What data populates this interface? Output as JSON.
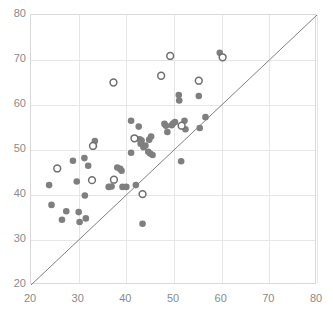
{
  "chart_data": {
    "type": "scatter",
    "title": "",
    "subtitle": "",
    "xlabel": "",
    "ylabel": "",
    "xlim": [
      20,
      80
    ],
    "ylim": [
      20,
      80
    ],
    "xticks": [
      20,
      30,
      40,
      50,
      60,
      70,
      80
    ],
    "yticks": [
      20,
      30,
      40,
      50,
      60,
      70,
      80
    ],
    "grid": true,
    "legend": "none",
    "annotations": [
      {
        "name": "identity-line",
        "type": "line",
        "description": "diagonal reference line y = x",
        "from": [
          20,
          20
        ],
        "to": [
          80,
          80
        ],
        "color": "#808080"
      }
    ],
    "colors": {
      "filled_marker": "#7f7f7f",
      "open_marker_fill": "#ffffff",
      "open_marker_stroke": "#6e6e6e",
      "grid": "#e6e6e6",
      "axis": "#d9d9d9",
      "tick_label": "#8a8a8a",
      "identity_line": "#808080"
    },
    "series": [
      {
        "name": "filled",
        "marker": "filled-circle",
        "color": "#7f7f7f",
        "points": [
          [
            23.8,
            42.2
          ],
          [
            24.3,
            37.8
          ],
          [
            26.5,
            34.5
          ],
          [
            27.4,
            36.4
          ],
          [
            28.8,
            47.6
          ],
          [
            29.6,
            43.0
          ],
          [
            30.0,
            36.2
          ],
          [
            30.2,
            34.0
          ],
          [
            31.2,
            48.2
          ],
          [
            31.3,
            39.9
          ],
          [
            31.5,
            34.8
          ],
          [
            32.0,
            46.5
          ],
          [
            33.2,
            51.0
          ],
          [
            33.4,
            52.0
          ],
          [
            36.3,
            41.8
          ],
          [
            36.9,
            41.9
          ],
          [
            38.1,
            46.1
          ],
          [
            38.7,
            45.8
          ],
          [
            39.0,
            45.4
          ],
          [
            39.2,
            41.8
          ],
          [
            40.0,
            41.8
          ],
          [
            41.0,
            56.5
          ],
          [
            41.0,
            49.4
          ],
          [
            42.0,
            42.2
          ],
          [
            42.6,
            55.2
          ],
          [
            42.8,
            52.4
          ],
          [
            43.0,
            51.4
          ],
          [
            43.2,
            52.1
          ],
          [
            43.4,
            33.6
          ],
          [
            43.6,
            50.6
          ],
          [
            44.0,
            51.0
          ],
          [
            44.6,
            49.6
          ],
          [
            44.8,
            52.3
          ],
          [
            45.0,
            49.2
          ],
          [
            45.2,
            53.0
          ],
          [
            45.5,
            48.9
          ],
          [
            48.0,
            55.8
          ],
          [
            48.3,
            55.4
          ],
          [
            48.6,
            54.0
          ],
          [
            49.5,
            55.5
          ],
          [
            49.8,
            55.9
          ],
          [
            50.2,
            56.2
          ],
          [
            51.0,
            62.2
          ],
          [
            51.1,
            61.0
          ],
          [
            51.5,
            47.5
          ],
          [
            52.2,
            56.5
          ],
          [
            52.4,
            54.6
          ],
          [
            55.2,
            62.0
          ],
          [
            55.4,
            54.9
          ],
          [
            56.6,
            57.3
          ],
          [
            59.6,
            71.6
          ]
        ]
      },
      {
        "name": "open",
        "marker": "open-circle",
        "color": "#ffffff",
        "stroke": "#6e6e6e",
        "points": [
          [
            25.5,
            45.9
          ],
          [
            32.8,
            43.3
          ],
          [
            33.0,
            50.9
          ],
          [
            37.3,
            65.0
          ],
          [
            37.4,
            43.4
          ],
          [
            41.7,
            52.6
          ],
          [
            43.4,
            40.2
          ],
          [
            47.3,
            66.5
          ],
          [
            49.2,
            70.9
          ],
          [
            51.6,
            55.4
          ],
          [
            55.2,
            65.4
          ],
          [
            60.2,
            70.6
          ]
        ]
      }
    ]
  }
}
